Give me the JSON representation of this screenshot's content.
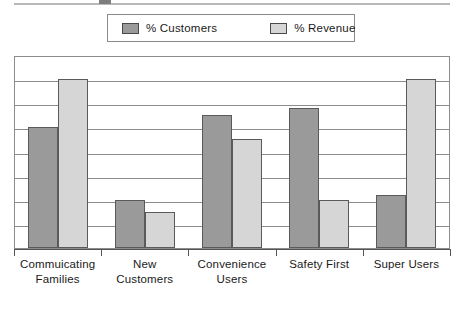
{
  "chart_data": {
    "type": "bar",
    "title": "",
    "subtitle": "",
    "xlabel": "",
    "ylabel": "",
    "ylim": [
      0,
      80
    ],
    "y_tick_step": 10,
    "y_tick_labels_visible": false,
    "grid": true,
    "gridline_count": 7,
    "legend_position": "top-center",
    "categories": [
      "Commuicating Families",
      "New Customers",
      "Convenience Users",
      "Safety First",
      "Super Users"
    ],
    "category_lines": [
      [
        "Commuicating",
        "Families"
      ],
      [
        "New",
        "Customers"
      ],
      [
        "Convenience",
        "Users"
      ],
      [
        "Safety First",
        ""
      ],
      [
        "Super Users",
        ""
      ]
    ],
    "series": [
      {
        "name": "% Customers",
        "color": "#9a9a9a",
        "values": [
          50,
          20,
          55,
          58,
          22
        ]
      },
      {
        "name": "% Revenue",
        "color": "#d6d6d6",
        "values": [
          70,
          15,
          45,
          20,
          70
        ]
      }
    ]
  },
  "legend": {
    "entries": [
      {
        "label": "% Customers",
        "swatch": "dark-swatch-icon"
      },
      {
        "label": "% Revenue",
        "swatch": "light-swatch-icon"
      }
    ]
  },
  "colors": {
    "series_customers": "#9a9a9a",
    "series_revenue": "#d6d6d6",
    "bar_border": "#5a5a5a",
    "gridline": "#8c8c8c",
    "frame": "#8c8c8c",
    "axis": "#555555",
    "text": "#1a1a1a",
    "background": "#ffffff"
  }
}
